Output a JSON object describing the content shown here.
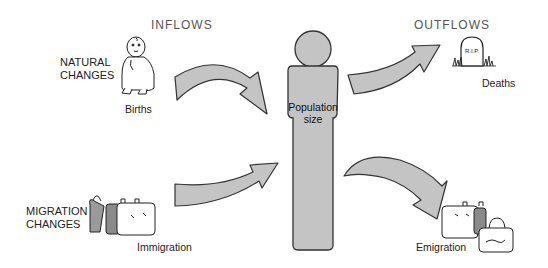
{
  "diagram": {
    "headers": {
      "inflows": "INFLOWS",
      "outflows": "OUTFLOWS"
    },
    "categories": {
      "natural": [
        "NATURAL",
        "CHANGES"
      ],
      "migration": [
        "MIGRATION",
        "CHANGES"
      ]
    },
    "center": {
      "label_line1": "Population",
      "label_line2": "size"
    },
    "flows": [
      {
        "id": "births",
        "label": "Births",
        "direction": "in",
        "type": "natural",
        "icon": "baby-icon"
      },
      {
        "id": "immigration",
        "label": "Immigration",
        "direction": "in",
        "type": "migration",
        "icon": "luggage-icon"
      },
      {
        "id": "deaths",
        "label": "Deaths",
        "direction": "out",
        "type": "natural",
        "icon": "tombstone-icon",
        "icon_text": "R.I.P."
      },
      {
        "id": "emigration",
        "label": "Emigration",
        "direction": "out",
        "type": "migration",
        "icon": "luggage-icon"
      }
    ],
    "colors": {
      "arrow_fill": "#c4c4c4",
      "figure_fill": "#c4c4c4",
      "stroke": "#333333",
      "background": "#ffffff"
    }
  }
}
